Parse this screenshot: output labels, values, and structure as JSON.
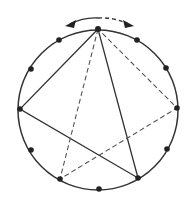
{
  "diagram": {
    "center": [
      98,
      110
    ],
    "radius": 80,
    "points": [
      [
        98,
        29
      ],
      [
        59,
        40
      ],
      [
        31,
        69
      ],
      [
        20,
        109
      ],
      [
        31,
        150
      ],
      [
        60,
        179
      ],
      [
        99,
        189
      ],
      [
        138,
        178
      ],
      [
        167,
        149
      ],
      [
        177,
        108
      ],
      [
        166,
        68
      ],
      [
        137,
        40
      ]
    ],
    "solid_triangle": [
      [
        98,
        29
      ],
      [
        20,
        109
      ],
      [
        138,
        178
      ]
    ],
    "dashed_triangle": [
      [
        98,
        29
      ],
      [
        60,
        179
      ],
      [
        177,
        108
      ]
    ],
    "colors": {
      "stroke": "#333333",
      "point": "#222222",
      "background": "#ffffff"
    }
  }
}
